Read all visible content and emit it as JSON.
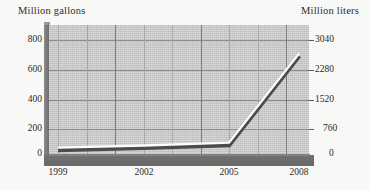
{
  "figure": {
    "left_axis_title": "Million gallons",
    "right_axis_title": "Million liters"
  },
  "chart_data": {
    "type": "line",
    "title": "",
    "subtitle": "",
    "xlabel": "",
    "ylabel": "Million gallons",
    "y2label": "Million liters",
    "x": [
      1999,
      2002,
      2005,
      2008
    ],
    "categories": [
      "1999",
      "2002",
      "2005",
      "2008"
    ],
    "series": [
      {
        "name": "Million gallons",
        "values": [
          30,
          45,
          65,
          690
        ]
      }
    ],
    "secondary_series": [
      {
        "name": "Million liters",
        "values": [
          114,
          171,
          247,
          2622
        ]
      }
    ],
    "xlim": [
      1999,
      2008
    ],
    "ylim": [
      0,
      900
    ],
    "y2lim": [
      0,
      3420
    ],
    "yticks": [
      0,
      200,
      400,
      600,
      800
    ],
    "ytick_labels": [
      "0",
      "200",
      "400",
      "600",
      "800"
    ],
    "y2ticks": [
      0,
      760,
      1520,
      2280,
      3040
    ],
    "y2tick_labels": [
      "0",
      "760",
      "1520",
      "2280",
      "3040"
    ],
    "xticks": [
      1999,
      2002,
      2005,
      2008
    ],
    "xtick_labels": [
      "1999",
      "2002",
      "2005",
      "2008"
    ],
    "grid": true,
    "grid_horizontal": true,
    "grid_vertical": true,
    "legend": false,
    "legend_position": "none",
    "style": "3d-ribbon",
    "annotations": []
  },
  "colors": {
    "plot_background": "#c9c9c9",
    "page_background": "#fbfbf9",
    "gridline_major": "#7e7e7e",
    "gridline_minor": "#a9a9a9",
    "gridline_horizontal": "#8e8e8e",
    "wall": "#6f6f6f",
    "floor": "#6a6a6a",
    "line_highlight": "#ffffff",
    "line_shadow": "#4a4a4a",
    "text": "#2b2b2b"
  },
  "axis": {
    "left_ticks": [
      {
        "label": "800",
        "top": 14
      },
      {
        "label": "600",
        "top": 44
      },
      {
        "label": "400",
        "top": 74
      },
      {
        "label": "200",
        "top": 103
      },
      {
        "label": "0",
        "top": 125
      }
    ],
    "right_ticks": [
      {
        "label": "3040",
        "top": 14
      },
      {
        "label": "2280",
        "top": 44
      },
      {
        "label": "1520",
        "top": 74
      },
      {
        "label": "760",
        "top": 103
      },
      {
        "label": "0",
        "top": 125
      }
    ],
    "x_ticks": [
      {
        "label": "1999",
        "left": 9
      },
      {
        "label": "2002",
        "left": 95
      },
      {
        "label": "2005",
        "left": 180
      },
      {
        "label": "2008",
        "left": 250
      }
    ]
  }
}
